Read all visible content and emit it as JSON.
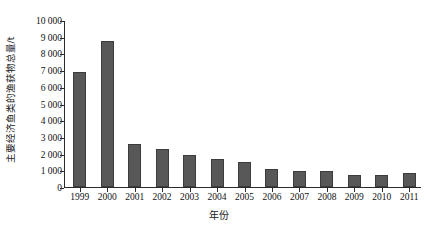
{
  "chart_data": {
    "type": "bar",
    "title": "",
    "subtitle": "",
    "xlabel": "年份",
    "ylabel": "主要经济鱼类的渔获物总量/t",
    "categories": [
      "1999",
      "2000",
      "2001",
      "2002",
      "2003",
      "2004",
      "2005",
      "2006",
      "2007",
      "2008",
      "2009",
      "2010",
      "2011"
    ],
    "values": [
      6900,
      8750,
      2550,
      2270,
      1900,
      1660,
      1500,
      1100,
      950,
      930,
      700,
      700,
      850
    ],
    "series": [
      {
        "name": "主要经济鱼类的渔获物总量",
        "values": [
          6900,
          8750,
          2550,
          2270,
          1900,
          1660,
          1500,
          1100,
          950,
          930,
          700,
          700,
          850
        ]
      }
    ],
    "ylim": [
      0,
      10000
    ],
    "ytick_values": [
      0,
      1000,
      2000,
      3000,
      4000,
      5000,
      6000,
      7000,
      8000,
      9000,
      10000
    ],
    "ytick_labels": [
      "0",
      "1 000",
      "2 000",
      "3 000",
      "4 000",
      "5 000",
      "6 000",
      "7 000",
      "8 000",
      "9 000",
      "10 000"
    ],
    "grid": false,
    "legend": false,
    "legend_position": "none",
    "bar_color": "#585858",
    "bar_edge_color": "#3c3c3c",
    "axis_color": "#2b2b2b",
    "background_color": "#ffffff",
    "annotations": []
  }
}
